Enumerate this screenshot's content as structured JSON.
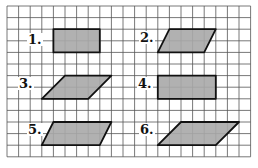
{
  "figure": {
    "grid": {
      "origin_x": 7,
      "origin_y": 6,
      "cell": 11.6,
      "cols": 21,
      "rows": 13,
      "line_color": "#555555",
      "background": "#ffffff"
    },
    "fill_color": "#a8a8a8",
    "stroke_color": "#111111",
    "shapes": [
      {
        "label": "1.",
        "kind": "rectangle",
        "points": [
          [
            4,
            2
          ],
          [
            8,
            2
          ],
          [
            8,
            4
          ],
          [
            4,
            4
          ]
        ],
        "label_pos": [
          28,
          44
        ]
      },
      {
        "label": "2.",
        "kind": "parallelogram",
        "points": [
          [
            14,
            2
          ],
          [
            18,
            2
          ],
          [
            17,
            4
          ],
          [
            13,
            4
          ]
        ],
        "label_pos": [
          140,
          42
        ]
      },
      {
        "label": "3.",
        "kind": "parallelogram",
        "points": [
          [
            5,
            6
          ],
          [
            9,
            6
          ],
          [
            7,
            8
          ],
          [
            3,
            8
          ]
        ],
        "label_pos": [
          19,
          88
        ]
      },
      {
        "label": "4.",
        "kind": "rectangle",
        "points": [
          [
            13,
            6
          ],
          [
            18,
            6
          ],
          [
            18,
            8
          ],
          [
            13,
            8
          ]
        ],
        "label_pos": [
          138,
          88
        ]
      },
      {
        "label": "5.",
        "kind": "parallelogram",
        "points": [
          [
            4,
            10
          ],
          [
            9,
            10
          ],
          [
            8,
            12
          ],
          [
            3,
            12
          ]
        ],
        "label_pos": [
          28,
          134
        ]
      },
      {
        "label": "6.",
        "kind": "parallelogram",
        "points": [
          [
            15,
            10
          ],
          [
            20,
            10
          ],
          [
            18,
            12
          ],
          [
            13,
            12
          ]
        ],
        "label_pos": [
          140,
          134
        ]
      }
    ]
  }
}
